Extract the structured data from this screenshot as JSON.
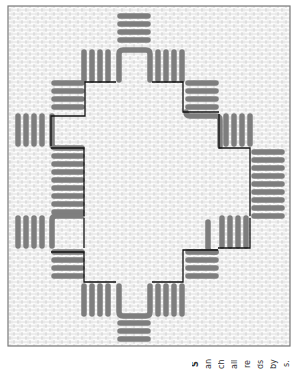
{
  "figure": {
    "type": "needlepoint-stitch-pattern",
    "colors": {
      "canvas_background": "#fbfbfb",
      "canvas_grid": "#cfcfcf",
      "frame_border": "#7a7a7a",
      "stitch_bars": "#7e7e7e",
      "outline": "#111111"
    }
  },
  "caption_fragments": [
    "s.",
    "by",
    "ds",
    "re",
    "all",
    "ch",
    "an",
    "S"
  ]
}
